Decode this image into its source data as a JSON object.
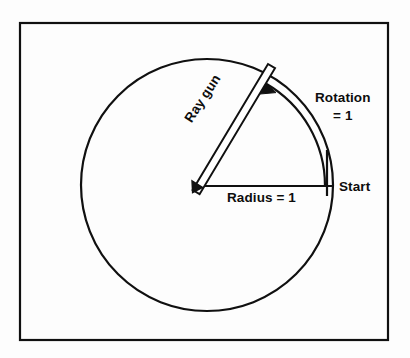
{
  "figure": {
    "name": "ray-gun-rotation-diagram",
    "background_color": "#fdfdfd",
    "ink_color": "#101010",
    "frame": {
      "x": 20,
      "y": 23,
      "width": 368,
      "height": 317,
      "stroke_width": 2.2
    },
    "circle": {
      "center_x": 207,
      "center_y": 185,
      "radius": 126,
      "stroke_width": 2.2
    },
    "radius_line": {
      "from_x": 196,
      "from_y": 186,
      "to_x": 333,
      "to_y": 186,
      "stroke_width": 2.2
    },
    "start_tick": {
      "x": 327,
      "y_top": 150,
      "y_bottom": 196,
      "stroke_width": 2.2
    },
    "rotation_arc": {
      "radius": 118,
      "start_angle_deg": 0,
      "end_angle_deg": 57,
      "direction": "counterclockwise",
      "stroke_width": 2.2,
      "has_arrowhead": true
    },
    "ray_gun": {
      "pivot_x": 196,
      "pivot_y": 186,
      "tip_x": 272,
      "tip_y": 67,
      "barrel_width": 8,
      "angle_deg": 57,
      "stroke_width": 2.0
    }
  },
  "labels": {
    "rotation_line1": "Rotation",
    "rotation_line2": "= 1",
    "start": "Start",
    "radius": "Radius  =  1",
    "ray_gun": "Ray gun"
  }
}
